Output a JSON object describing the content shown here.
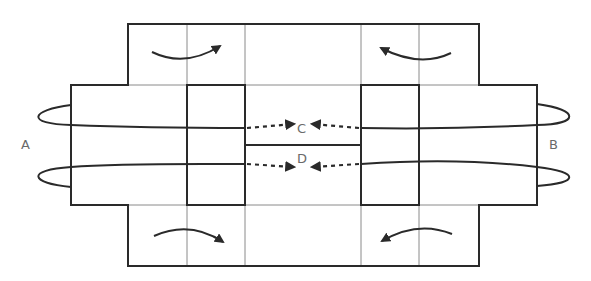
{
  "diagram": {
    "type": "folding-net",
    "labels": {
      "A": "A",
      "B": "B",
      "C": "C",
      "D": "D"
    },
    "colors": {
      "line": "#2a2a2a",
      "thin_line": "#8a8a8a",
      "label": "#6a6a6a",
      "background": "#ffffff"
    },
    "fold_arrows": [
      {
        "position": "top-left",
        "direction": "clockwise"
      },
      {
        "position": "top-right",
        "direction": "counter-clockwise"
      },
      {
        "position": "bottom-left",
        "direction": "clockwise"
      },
      {
        "position": "bottom-right",
        "direction": "counter-clockwise"
      }
    ],
    "wrap_loops": [
      {
        "side": "A",
        "count": 2
      },
      {
        "side": "B",
        "count": 2
      }
    ],
    "dotted_arrows": [
      {
        "target": "C",
        "from": [
          "left",
          "right"
        ]
      },
      {
        "target": "D",
        "from": [
          "left",
          "right"
        ]
      }
    ]
  }
}
